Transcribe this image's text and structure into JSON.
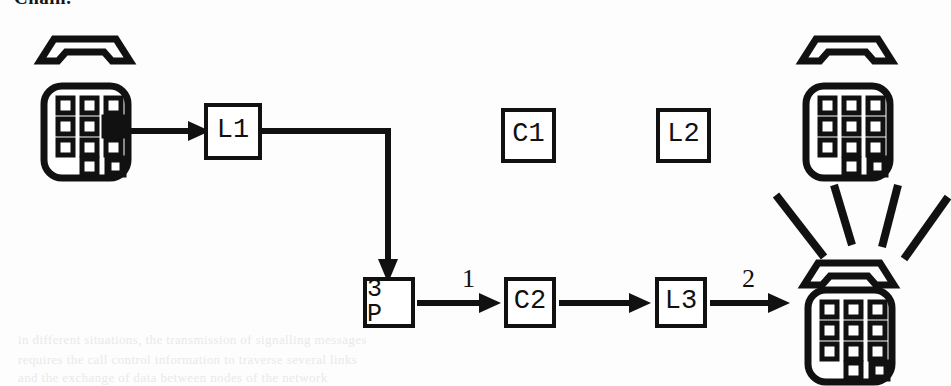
{
  "page": {
    "clipped_heading": "Chain.",
    "background_color": "#fdfdfd",
    "ink_color": "#111111",
    "width": 951,
    "height": 386
  },
  "diagram": {
    "title": "Chain.",
    "type": "call-flow-signaling-diagram",
    "nodes": [
      {
        "id": "L1",
        "label": "L1",
        "x": 204,
        "y": 103,
        "w": 58,
        "h": 57
      },
      {
        "id": "C1",
        "label": "C1",
        "x": 501,
        "y": 108,
        "w": 55,
        "h": 55
      },
      {
        "id": "L2",
        "label": "L2",
        "x": 656,
        "y": 108,
        "w": 55,
        "h": 55
      },
      {
        "id": "3P",
        "label": "3 P",
        "x": 363,
        "y": 277,
        "w": 52,
        "h": 51
      },
      {
        "id": "C2",
        "label": "C2",
        "x": 504,
        "y": 277,
        "w": 52,
        "h": 51
      },
      {
        "id": "L3",
        "label": "L3",
        "x": 655,
        "y": 277,
        "w": 52,
        "h": 51
      }
    ],
    "edges": [
      {
        "from": "phone-caller",
        "to": "L1",
        "label": "",
        "style": "straight-right"
      },
      {
        "from": "L1",
        "to": "3P",
        "label": "",
        "style": "elbow-right-down"
      },
      {
        "from": "3P",
        "to": "C2",
        "label": "1",
        "style": "straight-right"
      },
      {
        "from": "C2",
        "to": "L3",
        "label": "",
        "style": "straight-right"
      },
      {
        "from": "L3",
        "to": "phone-ringing",
        "label": "2",
        "style": "straight-right"
      }
    ],
    "edge_labels": [
      {
        "text": "1",
        "x": 462,
        "y": 268
      },
      {
        "text": "2",
        "x": 742,
        "y": 268
      }
    ],
    "phones": [
      {
        "id": "phone-caller",
        "name": "telephone-dialing-icon",
        "x": 32,
        "y": 28,
        "keypad_filled_key": [
          1,
          2
        ],
        "ringing": false,
        "handset": "on-hook-above"
      },
      {
        "id": "phone-idle",
        "name": "telephone-idle-icon",
        "x": 794,
        "y": 28,
        "keypad_filled_key": null,
        "ringing": false,
        "handset": "on-hook-above"
      },
      {
        "id": "phone-ringing",
        "name": "telephone-ringing-icon",
        "x": 794,
        "y": 235,
        "keypad_filled_key": null,
        "ringing": true,
        "handset": "on-hook-above"
      }
    ],
    "ghost_text": [
      {
        "text": "in different situations, the transmission of signalling messages",
        "x": 18,
        "y": 340
      },
      {
        "text": "requires the call control information to traverse several links",
        "x": 18,
        "y": 360
      },
      {
        "text": "and the exchange of data between nodes of the network",
        "x": 18,
        "y": 378
      }
    ]
  }
}
